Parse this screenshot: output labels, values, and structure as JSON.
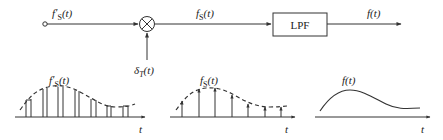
{
  "diagram": {
    "input_label": "f'S(t)",
    "multiplier_symbol": "⊗",
    "impulse_train_label": "δT(t)",
    "sampled_label": "fS(t)",
    "filter_label": "LPF",
    "output_label": "f(t)",
    "plots": [
      {
        "name": "sample-and-hold",
        "label": "f'S(t)",
        "axis_label": "t"
      },
      {
        "name": "impulse-sampled",
        "label": "fS(t)",
        "axis_label": "t"
      },
      {
        "name": "reconstructed",
        "label": "f(t)",
        "axis_label": "t"
      }
    ]
  },
  "colors": {
    "stroke": "#333333",
    "text": "#222222",
    "background": "#ffffff"
  }
}
